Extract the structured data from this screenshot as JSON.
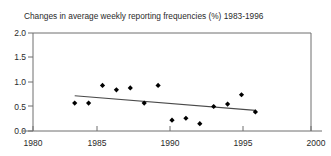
{
  "top_clipped_text": "ͷ ⁗ ᴀ ᴏ ᴎ ᴑ ᴑ ᴎ ᴏ",
  "chart_data": {
    "type": "scatter",
    "title": "Changes in average weekly reporting frequencies (%) 1983-1996",
    "xlabel": "",
    "ylabel": "",
    "xlim": [
      1980,
      2000
    ],
    "ylim": [
      0.0,
      2.0
    ],
    "grid": false,
    "legend": null,
    "xticks": [
      1980,
      1985,
      1990,
      1995,
      2000
    ],
    "xtick_labels": [
      "1980",
      "1985",
      "1990",
      "1995",
      "2000"
    ],
    "yticks": [
      0.0,
      0.5,
      1.0,
      1.5,
      2.0
    ],
    "ytick_labels": [
      "0.0",
      "0.5",
      "1.0",
      "1.5",
      "2.0"
    ],
    "marker": "diamond",
    "marker_color": "#000000",
    "x": [
      1983,
      1984,
      1985,
      1986,
      1987,
      1988,
      1989,
      1990,
      1991,
      1992,
      1993,
      1994,
      1995,
      1996
    ],
    "values": [
      0.57,
      0.57,
      0.93,
      0.84,
      0.88,
      0.57,
      0.93,
      0.22,
      0.26,
      0.15,
      0.5,
      0.55,
      0.74,
      0.39
    ],
    "points": [
      {
        "x": 1983,
        "y": 0.57
      },
      {
        "x": 1984,
        "y": 0.57
      },
      {
        "x": 1985,
        "y": 0.93
      },
      {
        "x": 1986,
        "y": 0.84
      },
      {
        "x": 1987,
        "y": 0.88
      },
      {
        "x": 1988,
        "y": 0.57
      },
      {
        "x": 1989,
        "y": 0.93
      },
      {
        "x": 1990,
        "y": 0.22
      },
      {
        "x": 1991,
        "y": 0.26
      },
      {
        "x": 1992,
        "y": 0.15
      },
      {
        "x": 1993,
        "y": 0.5
      },
      {
        "x": 1994,
        "y": 0.55
      },
      {
        "x": 1995,
        "y": 0.74
      },
      {
        "x": 1996,
        "y": 0.39
      }
    ],
    "trendline": {
      "name": "linear fit",
      "color": "#4a4a4a",
      "x_start": 1983,
      "y_start": 0.72,
      "x_end": 1996,
      "y_end": 0.42
    }
  }
}
